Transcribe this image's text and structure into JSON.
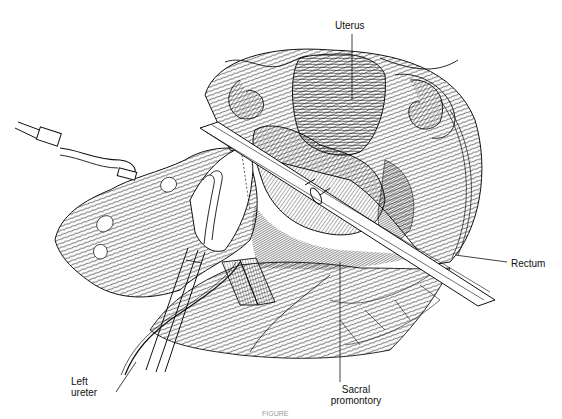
{
  "figure": {
    "type": "surgical line illustration",
    "caption_partial": "FIGURE",
    "labels": {
      "uterus": "Uterus",
      "rectum": "Rectum",
      "sacral_line1": "Sacral",
      "sacral_line2": "promontory",
      "ureter_line1": "Left",
      "ureter_line2": "ureter"
    },
    "colors": {
      "ink": "#111111",
      "background": "#ffffff"
    }
  }
}
